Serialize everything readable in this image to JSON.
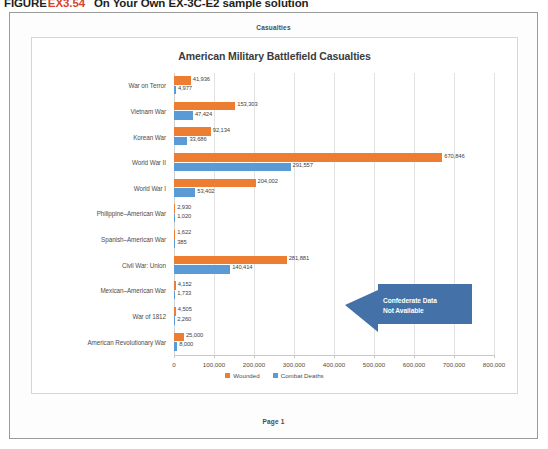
{
  "caption": {
    "label": "FIGURE",
    "number": "EX3.54",
    "text": "On Your Own EX-3C-E2 sample solution"
  },
  "document": {
    "header": "Casualties",
    "footer": "Page 1"
  },
  "colors": {
    "wounded": "#ED7D31",
    "combat_deaths": "#5B9BD5",
    "callout": "#4472A8",
    "grid": "#E2E2E2"
  },
  "callout": {
    "line1": "Confederate Data",
    "line2": "Not Available"
  },
  "chart_data": {
    "type": "bar",
    "orientation": "horizontal",
    "title": "American Military Battlefield Casualties",
    "xlabel": "",
    "ylabel": "",
    "xlim": [
      0,
      800000
    ],
    "xticks": [
      0,
      100000,
      200000,
      300000,
      400000,
      500000,
      600000,
      700000,
      800000
    ],
    "xticklabels": [
      "0",
      "100,000",
      "200,000",
      "300,000",
      "400,000",
      "500,000",
      "600,000",
      "700,000",
      "800,000"
    ],
    "grid": true,
    "legend_position": "bottom",
    "categories": [
      "War on Terror",
      "Vietnam War",
      "Korean War",
      "World War II",
      "World War I",
      "Philippine–American War",
      "Spanish–American War",
      "Civil War: Union",
      "Mexican–American War",
      "War of 1812",
      "American Revolutionary War"
    ],
    "series": [
      {
        "name": "Wounded",
        "color": "#ED7D31",
        "values": [
          41936,
          153303,
          92134,
          670846,
          204002,
          2930,
          1622,
          281881,
          4152,
          4505,
          25000
        ],
        "labels": [
          "41,936",
          "153,303",
          "92,134",
          "670,846",
          "204,002",
          "2,930",
          "1,622",
          "281,881",
          "4,152",
          "4,505",
          "25,000"
        ]
      },
      {
        "name": "Combat Deaths",
        "color": "#5B9BD5",
        "values": [
          4977,
          47424,
          33686,
          291557,
          53402,
          1020,
          385,
          140414,
          1733,
          2260,
          8000
        ],
        "labels": [
          "4,977",
          "47,424",
          "33,686",
          "291,557",
          "53,402",
          "1,020",
          "385",
          "140,414",
          "1,733",
          "2,260",
          "8,000"
        ]
      }
    ]
  }
}
